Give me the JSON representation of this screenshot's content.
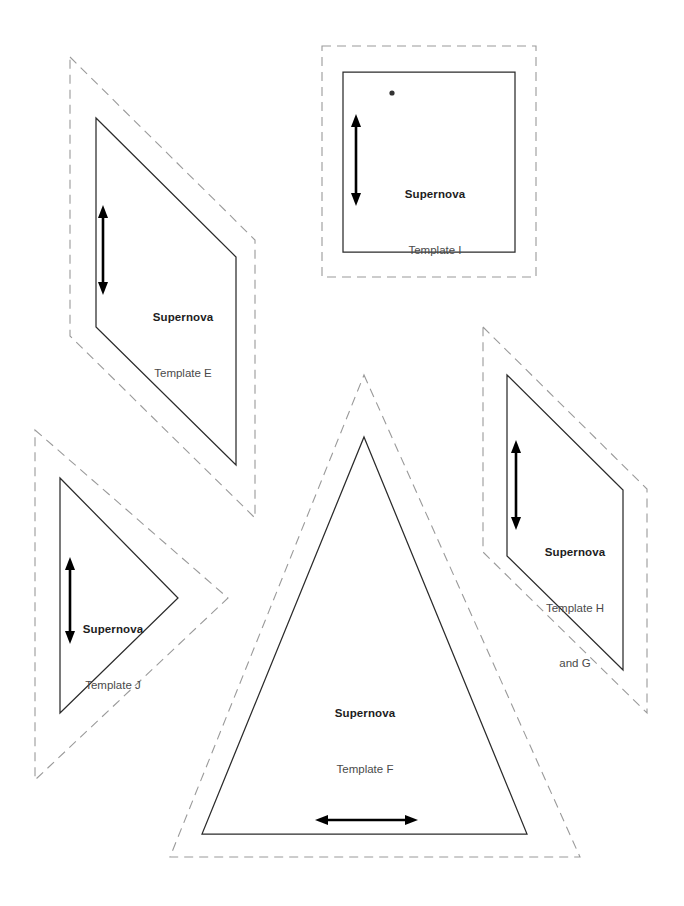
{
  "document": {
    "kind": "quilt-template-cutting-sheet",
    "brand": "Supernova",
    "page_background": "#ffffff",
    "cut_line_color": "#9a9a9a",
    "sew_line_color": "#2b2b2b",
    "grain_arrow_color": "#000000"
  },
  "templates": [
    {
      "id": "E",
      "shape": "parallelogram",
      "brand_label": "Supernova",
      "name_label": "Template E",
      "extra_label": "",
      "grain_direction": "vertical",
      "sew_points": "96,118 236,257 236,465 96,327",
      "cut_points": "70,57 255,240 255,518 70,336",
      "marker_dot": null
    },
    {
      "id": "I",
      "shape": "square",
      "brand_label": "Supernova",
      "name_label": "Template I",
      "extra_label": "",
      "grain_direction": "vertical",
      "sew_points": "343,72 515,72 515,252 343,252",
      "cut_points": "322,46 536,46 536,277 322,277",
      "marker_dot": "392,93"
    },
    {
      "id": "J",
      "shape": "triangle-right-pointing",
      "brand_label": "Supernova",
      "name_label": "Template J",
      "extra_label": "",
      "grain_direction": "vertical",
      "sew_points": "60,478 178,598 60,713",
      "cut_points": "35,430 228,598 35,780",
      "marker_dot": null
    },
    {
      "id": "H and G",
      "shape": "parallelogram",
      "brand_label": "Supernova",
      "name_label": "Template H",
      "extra_label": "and G",
      "grain_direction": "vertical",
      "sew_points": "507,375 623,490 623,670 507,556",
      "cut_points": "483,327 647,489 647,713 483,552",
      "marker_dot": null
    },
    {
      "id": "F",
      "shape": "triangle-isosceles",
      "brand_label": "Supernova",
      "name_label": "Template F",
      "extra_label": "",
      "grain_direction": "horizontal",
      "sew_points": "364,437 527,834 202,834",
      "cut_points": "364,375 580,857 170,857",
      "marker_dot": null
    }
  ],
  "grain_arrows": [
    {
      "for": "E",
      "orientation": "vertical",
      "from": "103,208",
      "to": "103,292"
    },
    {
      "for": "I",
      "orientation": "vertical",
      "from": "356,117",
      "to": "356,203"
    },
    {
      "for": "J",
      "orientation": "vertical",
      "from": "70,560",
      "to": "70,641"
    },
    {
      "for": "HG",
      "orientation": "vertical",
      "from": "516,443",
      "to": "516,527"
    },
    {
      "for": "F",
      "orientation": "horizontal",
      "from": "318,820",
      "to": "415,820"
    }
  ]
}
